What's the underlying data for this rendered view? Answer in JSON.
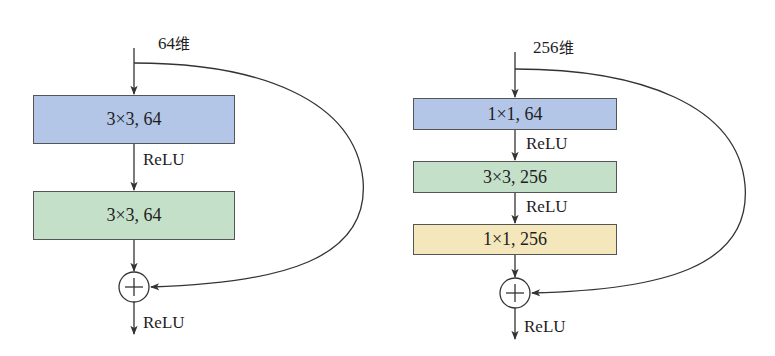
{
  "colors": {
    "blue_box": "#b4c6e7",
    "green_box": "#c5e0c9",
    "yellow_box": "#f3e7bb",
    "line": "#333333"
  },
  "left_block": {
    "input_label_num": "64",
    "input_label_unit": "维",
    "layers": [
      {
        "label": "3×3, 64",
        "color": "blue"
      },
      {
        "label": "3×3, 64",
        "color": "green"
      }
    ],
    "activations": [
      "ReLU"
    ],
    "add_symbol": "+",
    "output_activation": "ReLU"
  },
  "right_block": {
    "input_label_num": "256",
    "input_label_unit": "维",
    "layers": [
      {
        "label": "1×1, 64",
        "color": "blue"
      },
      {
        "label": "3×3, 256",
        "color": "green"
      },
      {
        "label": "1×1, 256",
        "color": "yellow"
      }
    ],
    "activations": [
      "ReLU",
      "ReLU"
    ],
    "add_symbol": "+",
    "output_activation": "ReLU"
  }
}
